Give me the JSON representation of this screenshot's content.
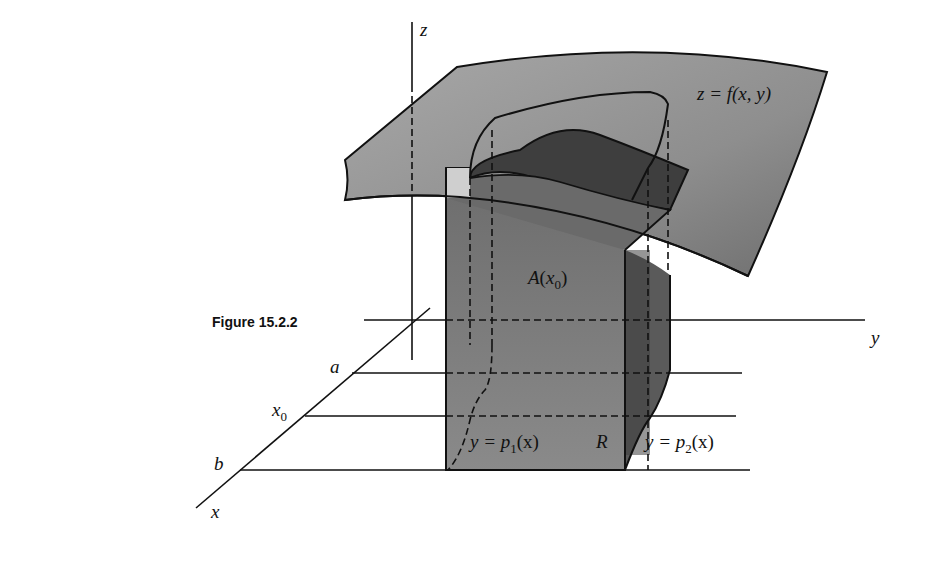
{
  "figure": {
    "caption": "Figure 15.2.2"
  },
  "axes": {
    "x_label": "x",
    "y_label": "y",
    "z_label": "z"
  },
  "x_ticks": {
    "a": "a",
    "x0_base": "x",
    "x0_sub": "0",
    "b": "b"
  },
  "labels": {
    "surface": {
      "prefix": "z = ",
      "f": "f",
      "args": "(x, y)"
    },
    "area": {
      "A": "A",
      "open": "(",
      "x": "x",
      "sub": "0",
      "close": ")"
    },
    "region": "R",
    "lower_boundary": {
      "lhs": "y = ",
      "p": "p",
      "sub": "1",
      "args": "(x)"
    },
    "upper_boundary": {
      "lhs": "y = ",
      "p": "p",
      "sub": "2",
      "args": "(x)"
    }
  },
  "colors": {
    "surface_fill": "#8c8c8c",
    "solid_front": "#7a7a7a",
    "solid_dark": "#4a4a4a",
    "solid_top": "#3e3e3e",
    "region_fill": "#9a9a9a",
    "outline": "#111111"
  }
}
